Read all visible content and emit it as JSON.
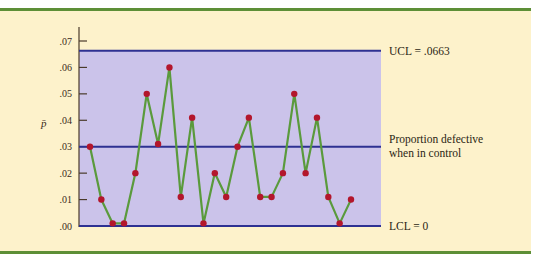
{
  "chart_data": {
    "type": "line",
    "title": "",
    "xlabel": "",
    "ylabel": "p̄",
    "ylim": [
      0,
      0.07
    ],
    "y_ticks": [
      ".00",
      ".01",
      ".02",
      ".03",
      ".04",
      ".05",
      ".06",
      ".07"
    ],
    "grid": false,
    "x": [
      1,
      2,
      3,
      4,
      5,
      6,
      7,
      8,
      9,
      10,
      11,
      12,
      13,
      14,
      15,
      16,
      17,
      18,
      19,
      20,
      21,
      22,
      23,
      24
    ],
    "series": [
      {
        "name": "Sample proportion defective",
        "values": [
          0.03,
          0.01,
          0.001,
          0.001,
          0.02,
          0.05,
          0.031,
          0.06,
          0.011,
          0.041,
          0.001,
          0.02,
          0.011,
          0.03,
          0.041,
          0.011,
          0.011,
          0.02,
          0.05,
          0.02,
          0.041,
          0.011,
          0.001,
          0.01
        ]
      }
    ],
    "reference_lines": [
      {
        "name": "UCL",
        "value": 0.0663,
        "label": "UCL = .0663"
      },
      {
        "name": "Center line",
        "value": 0.03,
        "label": "Proportion defective when in control",
        "label_lines": [
          "Proportion defective",
          "when in control"
        ]
      },
      {
        "name": "LCL",
        "value": 0,
        "label": "LCL = 0"
      }
    ],
    "colors": {
      "panel_background": "#fdf2cb",
      "control_region": "#cbc3ea",
      "control_lines": "#2e3192",
      "data_line": "#5a9a3c",
      "data_points": "#b3162c",
      "rules": "#5d8f36"
    }
  }
}
